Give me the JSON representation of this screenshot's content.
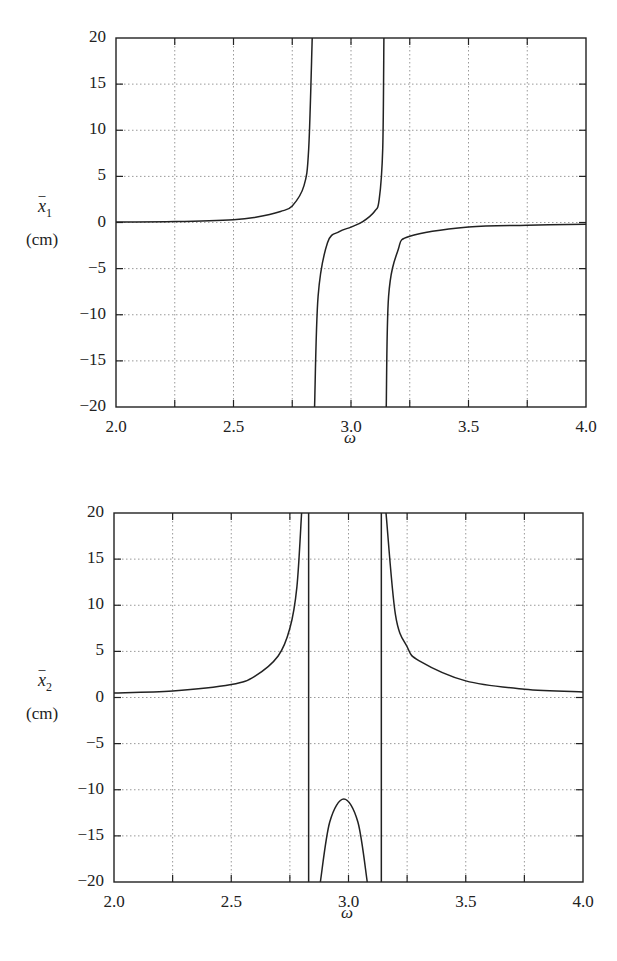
{
  "chart_data": [
    {
      "type": "line",
      "title": "",
      "xlabel": "ω",
      "ylabel": "x̄1 (cm)",
      "ylabel_symbol": "x",
      "ylabel_subscript": "1",
      "ylabel_unit": "(cm)",
      "xlim": [
        2.0,
        4.0
      ],
      "ylim": [
        -20,
        20
      ],
      "xticks": [
        "2.0",
        "2.5",
        "3.0",
        "3.5",
        "4.0"
      ],
      "yticks": [
        "20",
        "15",
        "10",
        "5",
        "0",
        "−5",
        "−10",
        "−15",
        "−20"
      ],
      "grid": true,
      "asymptotes": [
        2.84,
        3.145
      ],
      "series": [
        {
          "name": "x1",
          "x": [
            2.0,
            2.25,
            2.5,
            2.6,
            2.7,
            2.75,
            2.8,
            2.82,
            2.835,
            2.845,
            2.86,
            2.9,
            2.95,
            3.0,
            3.05,
            3.1,
            3.12,
            3.135,
            3.14,
            3.15,
            3.16,
            3.2,
            3.25,
            3.5,
            3.75,
            4.0
          ],
          "values": [
            0.05,
            0.1,
            0.3,
            0.6,
            1.2,
            1.8,
            4.0,
            8.0,
            20,
            -20,
            -8.0,
            -2.2,
            -1.0,
            -0.5,
            0.1,
            1.2,
            2.5,
            8.0,
            20,
            -20,
            -8.0,
            -3.0,
            -1.5,
            -0.5,
            -0.3,
            -0.2
          ]
        }
      ]
    },
    {
      "type": "line",
      "title": "",
      "xlabel": "ω",
      "ylabel": "x̄2 (cm)",
      "ylabel_symbol": "x",
      "ylabel_subscript": "2",
      "ylabel_unit": "(cm)",
      "xlim": [
        2.0,
        4.0
      ],
      "ylim": [
        -20,
        20
      ],
      "xticks": [
        "2.0",
        "2.5",
        "3.0",
        "3.5",
        "4.0"
      ],
      "yticks": [
        "20",
        "15",
        "10",
        "5",
        "0",
        "−5",
        "−10",
        "−15",
        "−20"
      ],
      "grid": true,
      "asymptotes": [
        2.83,
        3.14
      ],
      "series": [
        {
          "name": "x2",
          "x": [
            2.0,
            2.25,
            2.5,
            2.6,
            2.7,
            2.75,
            2.78,
            2.8,
            2.88,
            2.92,
            2.98,
            3.04,
            3.08,
            3.16,
            3.2,
            3.25,
            3.3,
            3.5,
            3.75,
            4.0
          ],
          "values": [
            0.5,
            0.7,
            1.4,
            2.3,
            4.5,
            7.5,
            12,
            20,
            -20,
            -13.5,
            -11,
            -13.5,
            -20,
            20,
            9.0,
            5.5,
            4.0,
            1.8,
            0.9,
            0.6
          ]
        }
      ]
    }
  ]
}
